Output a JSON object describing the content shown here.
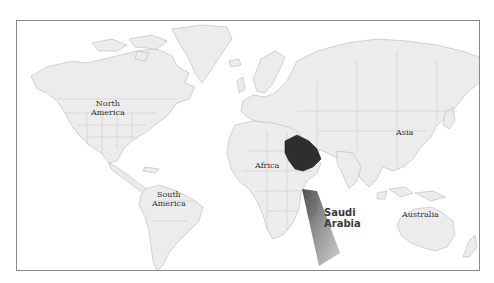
{
  "map": {
    "type": "world-locator-map",
    "highlighted_country": "Saudi Arabia",
    "colors": {
      "land": "#ececec",
      "border": "#b8b8b8",
      "ocean": "#ffffff",
      "highlight": "#2e2e2e",
      "frame": "#8a8a8a"
    },
    "continent_labels": [
      {
        "id": "north-america",
        "line1": "North",
        "line2": "America"
      },
      {
        "id": "south-america",
        "line1": "South",
        "line2": "America"
      },
      {
        "id": "africa",
        "line1": "Africa",
        "line2": ""
      },
      {
        "id": "asia",
        "line1": "Asia",
        "line2": ""
      },
      {
        "id": "australia",
        "line1": "Australia",
        "line2": ""
      }
    ],
    "callout": {
      "line1": "Saudi",
      "line2": "Arabia"
    }
  }
}
